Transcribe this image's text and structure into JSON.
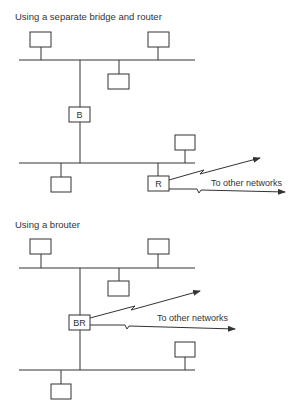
{
  "diagram": {
    "section1": {
      "title": "Using a separate bridge and router",
      "bridge_label": "B",
      "router_label": "R",
      "wan_label": "To other networks"
    },
    "section2": {
      "title": "Using a brouter",
      "brouter_label": "BR",
      "wan_label": "To other networks"
    }
  }
}
